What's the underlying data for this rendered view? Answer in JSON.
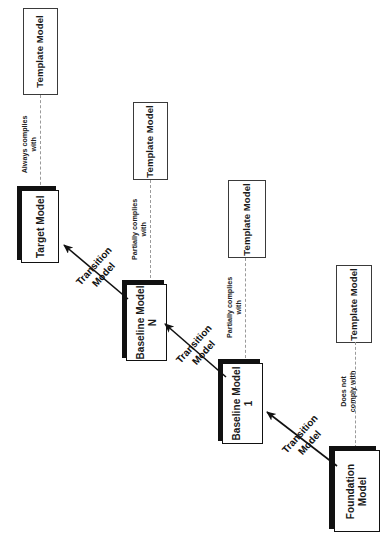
{
  "diagram": {
    "orientation": "rotated-90-ccw",
    "colors": {
      "box_fill": "#ffffff",
      "box_border": "#111111",
      "template_border": "#3a3a3a",
      "shadow": "#111111",
      "dashed_line": "#9a9a9a",
      "text": "#1a1a1a"
    },
    "nodes": [
      {
        "id": "template_target",
        "label": "Template Model",
        "style": "plain"
      },
      {
        "id": "target",
        "label": "Target Model",
        "style": "solid"
      },
      {
        "id": "template_baseline_n",
        "label": "Template Model",
        "style": "plain"
      },
      {
        "id": "baseline_n",
        "label": "Baseline Model",
        "label2": "N",
        "style": "solid"
      },
      {
        "id": "template_baseline_1",
        "label": "Template Model",
        "style": "plain"
      },
      {
        "id": "baseline_1",
        "label": "Baseline Model",
        "label2": "1",
        "style": "solid"
      },
      {
        "id": "template_foundation",
        "label": "Template Model",
        "style": "plain"
      },
      {
        "id": "foundation",
        "label": "Foundation",
        "label2": "Model",
        "style": "solid"
      }
    ],
    "compliance_edges": [
      {
        "id": "edge_target",
        "from": "target",
        "to": "template_target",
        "line1": "Always complies",
        "line2": "with"
      },
      {
        "id": "edge_baseline_n",
        "from": "baseline_n",
        "to": "template_baseline_n",
        "line1": "Partially complies",
        "line2": "with"
      },
      {
        "id": "edge_baseline_1",
        "from": "baseline_1",
        "to": "template_baseline_1",
        "line1": "Partially complies",
        "line2": "with"
      },
      {
        "id": "edge_foundation",
        "from": "foundation",
        "to": "template_foundation",
        "line1": "Does not",
        "line2": "comply with"
      }
    ],
    "transition_edges": [
      {
        "id": "transition_n_to_target",
        "from": "baseline_n",
        "to": "target",
        "line1": "Transition",
        "line2": "Model"
      },
      {
        "id": "transition_1_to_n",
        "from": "baseline_1",
        "to": "baseline_n",
        "line1": "Transition",
        "line2": "Model"
      },
      {
        "id": "transition_foundation_to_1",
        "from": "foundation",
        "to": "baseline_1",
        "line1": "Transition",
        "line2": "Model"
      }
    ]
  }
}
